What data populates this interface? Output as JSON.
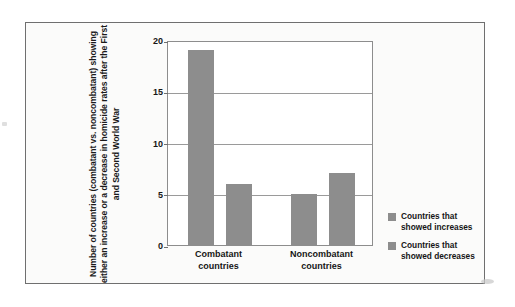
{
  "chart_data": {
    "type": "bar",
    "title": "",
    "xlabel": "",
    "ylabel": "Number of countries\n(combatant vs. noncombatant)\nshowing either an increase or a\ndecrease in homicide rates after\nthe First and Second World War",
    "categories": [
      "Combatant\ncountries",
      "Noncombatant\ncountries"
    ],
    "series": [
      {
        "name": "Countries that\nshowed increases",
        "values": [
          19,
          5
        ],
        "color": "#8d8d8d"
      },
      {
        "name": "Countries that\nshowed decreases",
        "values": [
          6,
          7
        ],
        "color": "#8d8d8d"
      }
    ],
    "ylim": [
      0,
      20
    ],
    "yticks": [
      0,
      5,
      10,
      15,
      20
    ],
    "ytick_labels": [
      "0",
      "5",
      "10",
      "15",
      "20"
    ],
    "grid": true,
    "legend_position": "right"
  },
  "legend": {
    "entries": [
      {
        "label": "Countries that\nshowed increases",
        "color": "#8d8d8d"
      },
      {
        "label": "Countries that\nshowed decreases",
        "color": "#8d8d8d"
      }
    ]
  },
  "colors": {
    "bar": "#8d8d8d",
    "gridline": "#9a9a9a",
    "plot_border": "#8d8d8d",
    "figure_border": "#6f6f6f",
    "figure_background": "#fbfbfa",
    "plot_background": "#ffffff",
    "text": "#161616"
  }
}
